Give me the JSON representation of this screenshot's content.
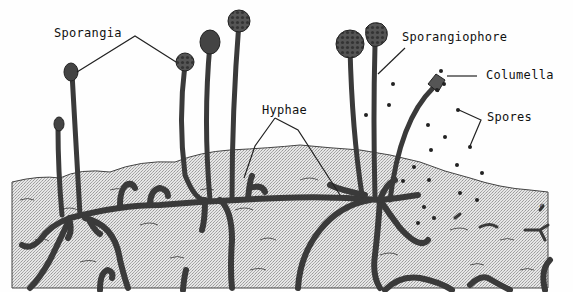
{
  "figure": {
    "labels": {
      "sporangia": "Sporangia",
      "hyphae": "Hyphae",
      "sporangiophore": "Sporangiophore",
      "columella": "Columella",
      "spores": "Spores"
    },
    "signature": "ꝯ",
    "colors": {
      "ink": "#2a2a2a",
      "hypha_fill": "#555555",
      "substrate": "#d4d4d4",
      "background": "#fefefe"
    }
  }
}
